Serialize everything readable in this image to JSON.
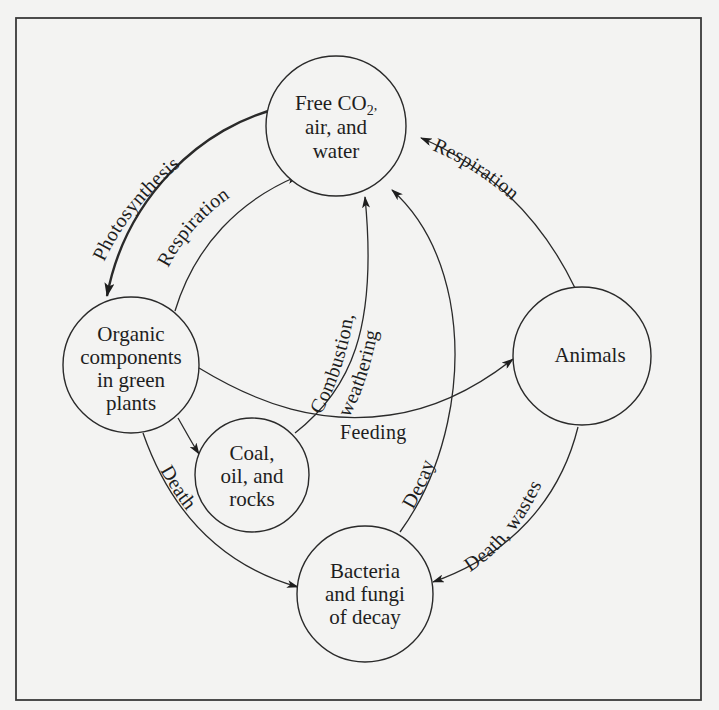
{
  "diagram": {
    "colors": {
      "background": "#f3f3f2",
      "ink": "#222222"
    },
    "nodes": {
      "free_co2": {
        "line1_prefix": "Free CO",
        "line1_subscript": "2",
        "line1_suffix": ",",
        "line2": "air, and",
        "line3": "water"
      },
      "organic": {
        "line1": "Organic",
        "line2": "components",
        "line3": "in green",
        "line4": "plants"
      },
      "animals": {
        "line1": "Animals"
      },
      "coal": {
        "line1": "Coal,",
        "line2": "oil, and",
        "line3": "rocks"
      },
      "bacteria": {
        "line1": "Bacteria",
        "line2": "and fungi",
        "line3": "of decay"
      }
    },
    "edges": {
      "photosynthesis": {
        "label": "Photosynthesis",
        "from": "Free CO2, air, and water",
        "to": "Organic components in green plants"
      },
      "respiration_plants": {
        "label": "Respiration",
        "from": "Organic components in green plants",
        "to": "Free CO2, air, and water"
      },
      "respiration_animals": {
        "label": "Respiration",
        "from": "Animals",
        "to": "Free CO2, air, and water"
      },
      "combustion": {
        "label_line1": "Combustion,",
        "label_line2": "weathering",
        "from": "Coal, oil, and rocks",
        "to": "Free CO2, air, and water"
      },
      "feeding": {
        "label": "Feeding",
        "from": "Organic components in green plants",
        "to": "Animals"
      },
      "decay": {
        "label": "Decay",
        "from": "Bacteria and fungi of decay",
        "to": "Free CO2, air, and water"
      },
      "death_plants": {
        "label": "Death",
        "from": "Organic components in green plants",
        "to": "Bacteria and fungi of decay"
      },
      "death_wastes": {
        "label": "Death, wastes",
        "from": "Animals",
        "to": "Bacteria and fungi of decay"
      },
      "fossilization": {
        "label": "",
        "from": "Organic components in green plants",
        "to": "Coal, oil, and rocks"
      }
    }
  }
}
